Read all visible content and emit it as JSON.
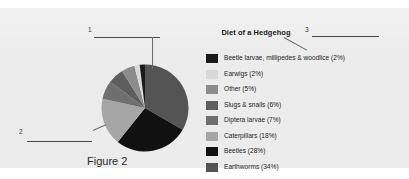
{
  "panel": {
    "background_color": "#ececec"
  },
  "figure": {
    "caption": "Figure 2"
  },
  "annotations": [
    {
      "number": "1",
      "target": "pie-top-slice"
    },
    {
      "number": "2",
      "target": "pie-left-slice"
    },
    {
      "number": "3",
      "target": "legend-first-entry"
    }
  ],
  "chart_data": {
    "type": "pie",
    "title": "Diet of a Hedgehog",
    "legend_position": "right",
    "start_angle": 0,
    "direction": "clockwise",
    "categories": [
      "Beetle larvae, millipedes & woodlice",
      "Earwigs",
      "Other",
      "Slugs & snails",
      "Diptera larvae",
      "Caterpillars",
      "Beetles",
      "Earthworms"
    ],
    "values": [
      2,
      2,
      5,
      6,
      7,
      18,
      28,
      34
    ],
    "colors": [
      "#1a1a1a",
      "#d9d9d9",
      "#8c8c8c",
      "#5e5e5e",
      "#6f6f6f",
      "#a6a6a6",
      "#111111",
      "#545454"
    ],
    "legend": [
      {
        "label": "Beetle larvae, millipedes & woodlice (2%)",
        "color": "#1a1a1a",
        "value": 2
      },
      {
        "label": "Earwigs (2%)",
        "color": "#d9d9d9",
        "value": 2
      },
      {
        "label": "Other (5%)",
        "color": "#8c8c8c",
        "value": 5
      },
      {
        "label": "Slugs & snails (6%)",
        "color": "#5e5e5e",
        "value": 6
      },
      {
        "label": "Diptera larvae (7%)",
        "color": "#6f6f6f",
        "value": 7
      },
      {
        "label": "Caterpillars (18%)",
        "color": "#a6a6a6",
        "value": 18
      },
      {
        "label": "Beetles (28%)",
        "color": "#111111",
        "value": 28
      },
      {
        "label": "Earthworms (34%)",
        "color": "#545454",
        "value": 34
      }
    ],
    "xlabel": "",
    "ylabel": "",
    "units": "percent"
  }
}
